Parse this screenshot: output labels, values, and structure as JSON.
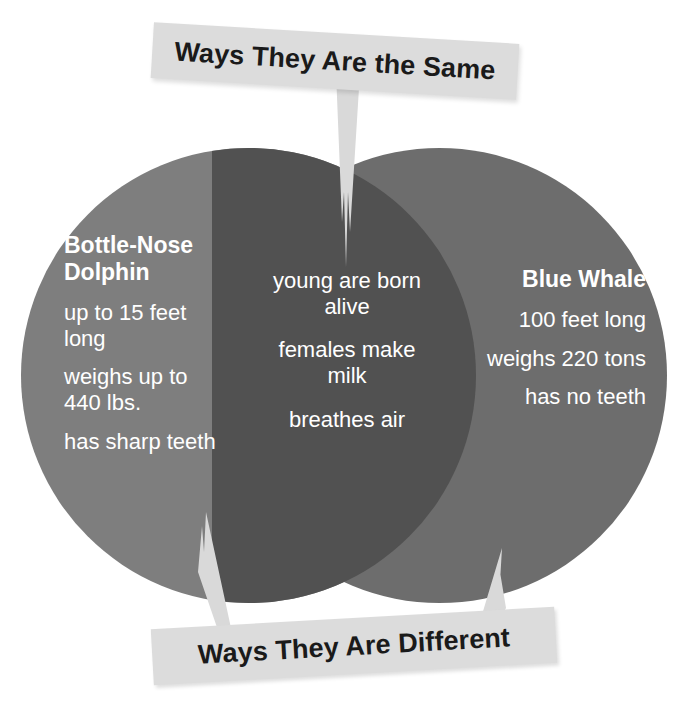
{
  "diagram": {
    "type": "venn",
    "title_top": "Ways They Are the Same",
    "title_bottom": "Ways They Are Different",
    "colors": {
      "background": "#ffffff",
      "left_circle": "#7e7e7e",
      "right_circle": "#6d6d6d",
      "overlap": "#515151",
      "banner": "#dcdcdc",
      "banner_text": "#1a1a1a",
      "circle_text": "#ffffff",
      "pointer": "#d9d9d9"
    },
    "left": {
      "heading": "Bottle-Nose Dolphin",
      "items": [
        "up to 15 feet long",
        "weighs up to 440 lbs.",
        "has sharp teeth"
      ]
    },
    "right": {
      "heading": "Blue Whale",
      "items": [
        "100 feet long",
        "weighs 220 tons",
        "has no teeth"
      ]
    },
    "center": {
      "items": [
        "young are born alive",
        "females make milk",
        "breathes air"
      ]
    }
  }
}
